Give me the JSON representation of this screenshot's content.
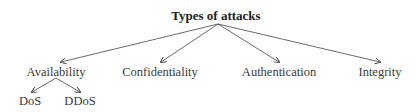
{
  "diagram": {
    "type": "tree",
    "root": {
      "label": "Types of attacks"
    },
    "children": [
      {
        "label": "Availability",
        "children": [
          {
            "label": "DoS"
          },
          {
            "label": "DDoS"
          }
        ]
      },
      {
        "label": "Confidentiality"
      },
      {
        "label": "Authentication"
      },
      {
        "label": "Integrity"
      }
    ],
    "colors": {
      "text": "#3a3a3a",
      "edge": "#444444",
      "background": "#ffffff"
    }
  }
}
